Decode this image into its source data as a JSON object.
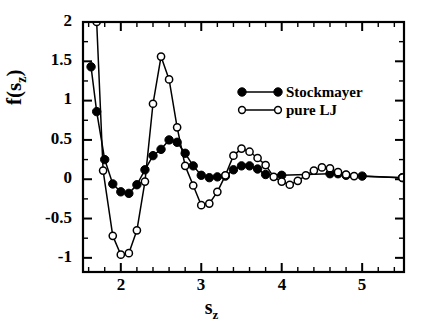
{
  "chart_data": {
    "type": "line",
    "title": "",
    "xlabel": "s_z",
    "xlabel_base": "s",
    "xlabel_sub": "z",
    "ylabel": "f(s_z)",
    "ylabel_pre": "f(s",
    "ylabel_sub": "z",
    "ylabel_post": ")",
    "xlim": [
      1.53,
      5.52
    ],
    "ylim": [
      -1.18,
      2.0
    ],
    "grid": false,
    "legend_position": "upper right",
    "x_major_ticks": [
      2,
      3,
      4,
      5
    ],
    "x_major_tick_labels": [
      "2",
      "3",
      "4",
      "5"
    ],
    "x_minor_tick_step": 0.2,
    "y_major_ticks": [
      -1,
      -0.5,
      0,
      0.5,
      1,
      1.5,
      2
    ],
    "y_major_tick_labels": [
      "-1",
      "-0.5",
      "0",
      "0.5",
      "1",
      "1.5",
      "2"
    ],
    "y_minor_tick_step": 0.25,
    "series": [
      {
        "name": "Stockmayer",
        "marker": "filled-circle",
        "color": "#000000",
        "x": [
          1.63,
          1.7,
          1.8,
          1.9,
          2.0,
          2.1,
          2.2,
          2.3,
          2.4,
          2.5,
          2.6,
          2.7,
          2.8,
          2.9,
          3.0,
          3.1,
          3.2,
          3.3,
          3.4,
          3.5,
          3.6,
          3.7,
          3.8,
          4.0,
          4.6,
          4.7,
          4.8,
          5.0,
          5.5
        ],
        "y": [
          1.43,
          0.86,
          0.25,
          -0.06,
          -0.16,
          -0.18,
          -0.07,
          0.12,
          0.3,
          0.38,
          0.5,
          0.47,
          0.33,
          0.17,
          0.05,
          0.02,
          0.03,
          0.04,
          0.12,
          0.17,
          0.17,
          0.13,
          0.06,
          0.05,
          0.07,
          0.07,
          0.05,
          0.04,
          0.02
        ]
      },
      {
        "name": "pure LJ",
        "marker": "open-circle",
        "color": "#000000",
        "x": [
          1.7,
          1.78,
          1.9,
          2.0,
          2.1,
          2.2,
          2.3,
          2.4,
          2.5,
          2.6,
          2.7,
          2.8,
          2.9,
          3.0,
          3.1,
          3.2,
          3.3,
          3.4,
          3.5,
          3.6,
          3.7,
          3.8,
          3.9,
          4.0,
          4.1,
          4.2,
          4.3,
          4.4,
          4.5,
          4.6,
          4.7,
          4.8,
          4.9,
          5.5
        ],
        "y": [
          2.0,
          0.11,
          -0.72,
          -0.96,
          -0.94,
          -0.65,
          -0.03,
          0.96,
          1.56,
          1.27,
          0.66,
          0.17,
          -0.08,
          -0.33,
          -0.31,
          -0.16,
          0.05,
          0.3,
          0.39,
          0.35,
          0.27,
          0.18,
          0.03,
          -0.03,
          -0.07,
          -0.02,
          0.05,
          0.11,
          0.15,
          0.14,
          0.09,
          0.06,
          0.04,
          0.02
        ]
      }
    ]
  },
  "legend": {
    "items": [
      {
        "label": "Stockmayer",
        "marker": "filled-circle"
      },
      {
        "label": "pure LJ",
        "marker": "open-circle"
      }
    ]
  },
  "axis_labels": {
    "y_ticks": [
      "2",
      "1.5",
      "1",
      "0.5",
      "0",
      "-0.5",
      "-1"
    ],
    "x_ticks": [
      "2",
      "3",
      "4",
      "5"
    ]
  }
}
